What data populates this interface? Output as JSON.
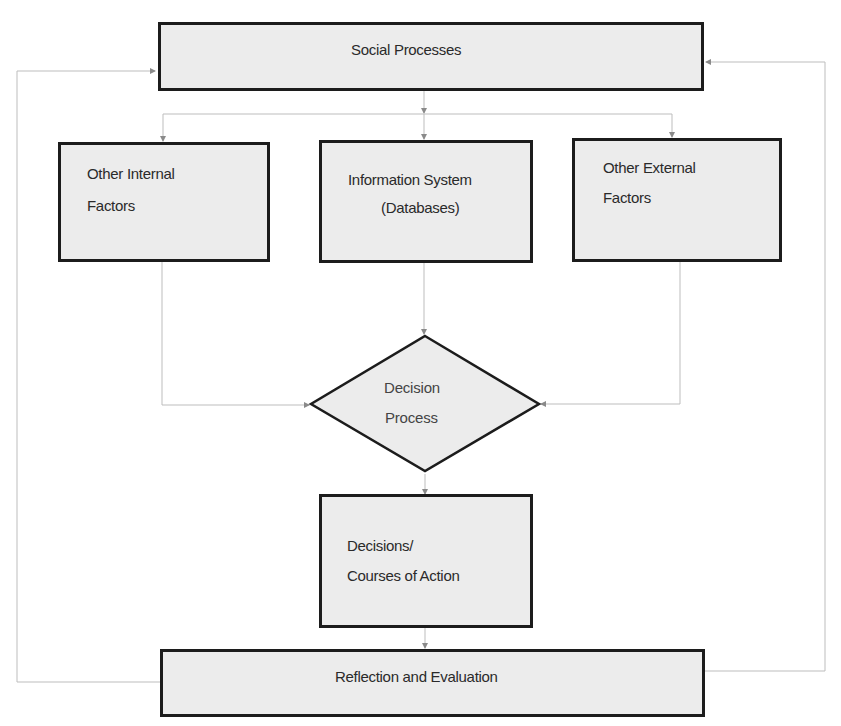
{
  "diagram": {
    "nodes": {
      "social_processes": {
        "label": "Social Processes",
        "shape": "rectangle"
      },
      "other_internal": {
        "line1": "Other Internal",
        "line2": "Factors",
        "shape": "rectangle"
      },
      "information_system": {
        "line1": "Information System",
        "line2": "(Databases)",
        "shape": "rectangle"
      },
      "other_external": {
        "line1": "Other External",
        "line2": "Factors",
        "shape": "rectangle"
      },
      "decision_process": {
        "line1": "Decision",
        "line2": "Process",
        "shape": "diamond"
      },
      "decisions": {
        "line1": "Decisions/",
        "line2": "Courses of Action",
        "shape": "rectangle"
      },
      "reflection": {
        "label": "Reflection and Evaluation",
        "shape": "rectangle"
      }
    },
    "edges": [
      {
        "from": "social_processes",
        "to": "other_internal"
      },
      {
        "from": "social_processes",
        "to": "information_system"
      },
      {
        "from": "social_processes",
        "to": "other_external"
      },
      {
        "from": "other_internal",
        "to": "decision_process"
      },
      {
        "from": "information_system",
        "to": "decision_process"
      },
      {
        "from": "other_external",
        "to": "decision_process"
      },
      {
        "from": "decision_process",
        "to": "decisions"
      },
      {
        "from": "decisions",
        "to": "reflection"
      },
      {
        "from": "reflection",
        "to": "social_processes",
        "route": "left-loop"
      },
      {
        "from": "reflection",
        "to": "social_processes",
        "route": "right-loop"
      }
    ],
    "colors": {
      "box_fill": "#ececec",
      "box_border": "#1c1c1c",
      "connector": "#b5b5b5",
      "text": "#2a2a2a"
    }
  }
}
